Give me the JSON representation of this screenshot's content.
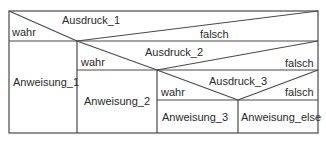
{
  "diagram": {
    "type": "nassi-shneiderman",
    "colors": {
      "line": "#4a4a4a",
      "text": "#2a2a2a",
      "background": "#ffffff"
    },
    "decision_1": {
      "condition": "Ausdruck_1",
      "true_label": "wahr",
      "false_label": "falsch",
      "true_branch": "Anweisung_1"
    },
    "decision_2": {
      "condition": "Ausdruck_2",
      "true_label": "wahr",
      "false_label": "falsch",
      "true_branch": "Anweisung_2"
    },
    "decision_3": {
      "condition": "Ausdruck_3",
      "true_label": "wahr",
      "false_label": "falsch",
      "true_branch": "Anweisung_3",
      "false_branch": "Anweisung_else"
    }
  }
}
